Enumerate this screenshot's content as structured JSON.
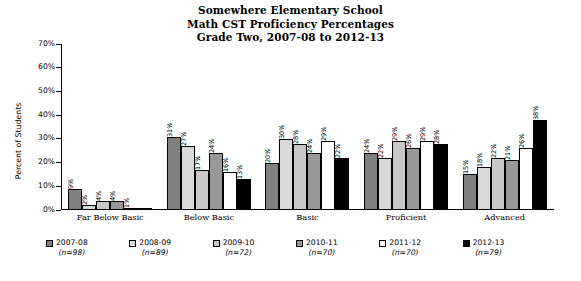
{
  "title": {
    "line1": "Somewhere Elementary School",
    "line2": "Math CST Proficiency Percentages",
    "line3": "Grade Two, 2007-08 to 2012-13"
  },
  "axis": {
    "ylabel": "Percent of Students",
    "yticks": [
      "0%",
      "10%",
      "20%",
      "30%",
      "40%",
      "50%",
      "60%",
      "70%"
    ]
  },
  "legend": [
    {
      "label": "2007-08",
      "n": "(n=98)",
      "color": "#808080"
    },
    {
      "label": "2008-09",
      "n": "(n=89)",
      "color": "#d9d9d9"
    },
    {
      "label": "2009-10",
      "n": "(n=72)",
      "color": "#c8c8c8"
    },
    {
      "label": "2010-11",
      "n": "(n=70)",
      "color": "#989898"
    },
    {
      "label": "2011-12",
      "n": "(n=70)",
      "color": "#ffffff"
    },
    {
      "label": "2012-13",
      "n": "(n=79)",
      "color": "#000000"
    }
  ],
  "chart_data": {
    "type": "bar",
    "title": "Somewhere Elementary School Math CST Proficiency Percentages Grade Two, 2007-08 to 2012-13",
    "xlabel": "",
    "ylabel": "Percent of Students",
    "ylim": [
      0,
      70
    ],
    "ytick_step": 10,
    "grid": false,
    "legend_position": "bottom",
    "categories": [
      "Far Below Basic",
      "Below Basic",
      "Basic",
      "Proficient",
      "Advanced"
    ],
    "series": [
      {
        "name": "2007-08",
        "n": 98,
        "color": "#808080",
        "values": [
          9,
          31,
          20,
          24,
          15
        ],
        "labels": [
          "9%",
          "31%",
          "20%",
          "24%",
          "15%"
        ]
      },
      {
        "name": "2008-09",
        "n": 89,
        "color": "#d9d9d9",
        "values": [
          2,
          27,
          30,
          22,
          18
        ],
        "labels": [
          "2%",
          "27%",
          "30%",
          "22%",
          "18%"
        ]
      },
      {
        "name": "2009-10",
        "n": 72,
        "color": "#c8c8c8",
        "values": [
          4,
          17,
          28,
          29,
          22
        ],
        "labels": [
          "4%",
          "17%",
          "28%",
          "29%",
          "22%"
        ]
      },
      {
        "name": "2010-11",
        "n": 70,
        "color": "#989898",
        "values": [
          4,
          24,
          24,
          26,
          21
        ],
        "labels": [
          "4%",
          "24%",
          "24%",
          "26%",
          "21%"
        ]
      },
      {
        "name": "2011-12",
        "n": 70,
        "color": "#ffffff",
        "values": [
          1,
          16,
          29,
          29,
          26
        ],
        "labels": [
          "1%",
          "16%",
          "29%",
          "29%",
          "26%"
        ]
      },
      {
        "name": "2012-13",
        "n": 79,
        "color": "#000000",
        "values": [
          0,
          13,
          22,
          28,
          38
        ],
        "labels": [
          "",
          "13%",
          "22%",
          "28%",
          "38%"
        ]
      }
    ]
  }
}
